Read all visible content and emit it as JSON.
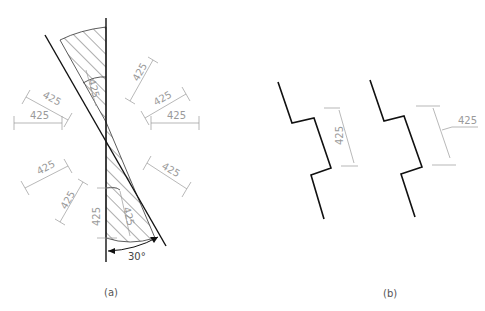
{
  "figure": {
    "panels": [
      {
        "id": "a",
        "caption": "(a)",
        "description": "Dimension text orientation for linear dimensions in various directions; hatched 30° zone where dimensions should be avoided",
        "dimension_value": "425",
        "angle_label": "30°",
        "dimension_count": 10
      },
      {
        "id": "b",
        "caption": "(b)",
        "description": "Dimension text placement within the 30° zone: inline and with leader",
        "dimension_value_inline": "425",
        "dimension_value_leader": "425"
      }
    ]
  }
}
